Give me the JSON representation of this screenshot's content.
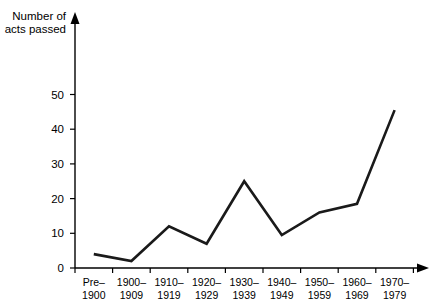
{
  "chart_data": {
    "type": "line",
    "title": "",
    "subtitle": "",
    "xlabel": "",
    "ylabel": "Number of acts passed",
    "ylabel_line1": "Number of",
    "ylabel_line2": "acts passed",
    "categories": [
      "Pre-1900",
      "1900-1909",
      "1910-1919",
      "1920-1929",
      "1930-1939",
      "1940-1949",
      "1950-1959",
      "1960-1969",
      "1970-1979"
    ],
    "category_labels": [
      {
        "line1": "Pre–",
        "line2": "1900"
      },
      {
        "line1": "1900–",
        "line2": "1909"
      },
      {
        "line1": "1910–",
        "line2": "1919"
      },
      {
        "line1": "1920–",
        "line2": "1929"
      },
      {
        "line1": "1930–",
        "line2": "1939"
      },
      {
        "line1": "1940–",
        "line2": "1949"
      },
      {
        "line1": "1950–",
        "line2": "1959"
      },
      {
        "line1": "1960–",
        "line2": "1969"
      },
      {
        "line1": "1970–",
        "line2": "1979"
      }
    ],
    "values": [
      4,
      2,
      12,
      7,
      25,
      9.5,
      16,
      18.5,
      45.5
    ],
    "series": [
      {
        "name": "Number of acts passed",
        "values": [
          4,
          2,
          12,
          7,
          25,
          9.5,
          16,
          18.5,
          45.5
        ]
      }
    ],
    "ylim": [
      0,
      57
    ],
    "y_ticks": [
      0,
      10,
      20,
      30,
      40,
      50
    ],
    "y_tick_labels": [
      "0",
      "10",
      "20",
      "30",
      "40",
      "50"
    ],
    "grid": false,
    "legend": "none",
    "line_color": "#1a1a1a",
    "axis_color": "#000000",
    "background_color": "#ffffff"
  }
}
